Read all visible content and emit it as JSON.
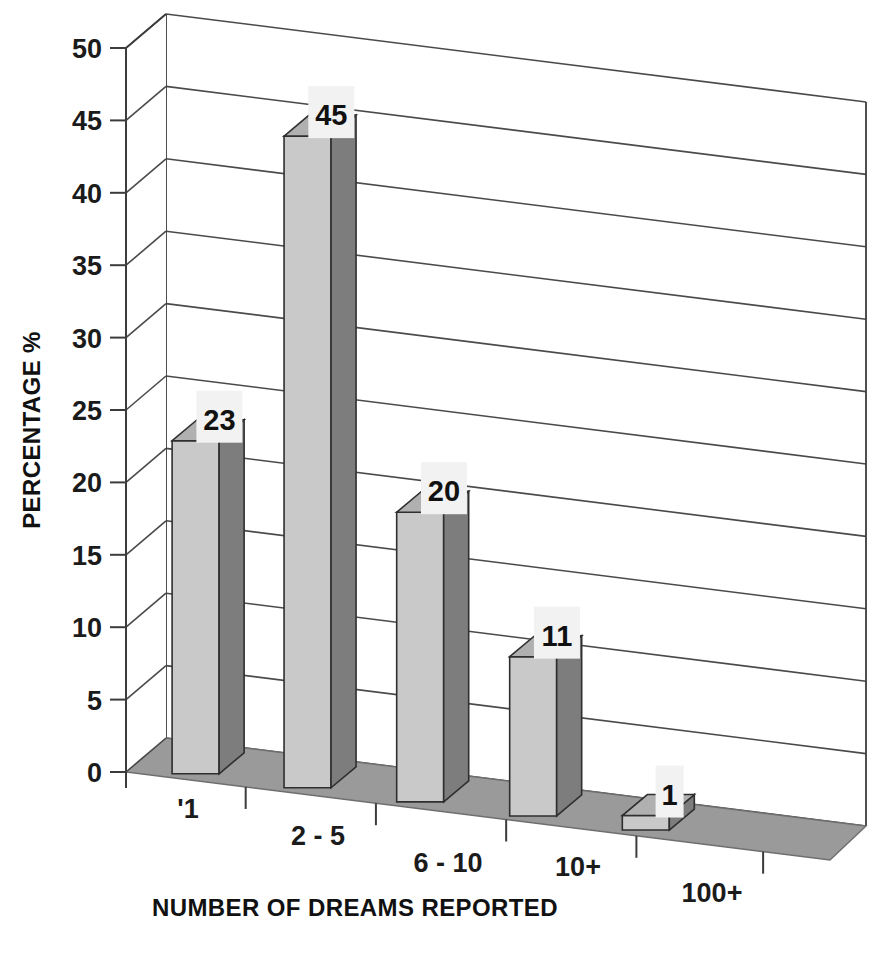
{
  "chart_data": {
    "type": "bar",
    "title": "",
    "subtitle": "",
    "xlabel": "NUMBER OF DREAMS REPORTED",
    "ylabel": "PERCENTAGE %",
    "categories": [
      "'1",
      "2 - 5",
      "6 - 10",
      "10+",
      "100+"
    ],
    "values": [
      23,
      45,
      20,
      11,
      1
    ],
    "data_labels": [
      "23",
      "45",
      "20",
      "11",
      "1"
    ],
    "ylim": [
      0,
      50
    ],
    "ytick_step": 5,
    "ytick_labels": [
      "0",
      "5",
      "10",
      "15",
      "20",
      "25",
      "30",
      "35",
      "40",
      "45",
      "50"
    ],
    "grid": true,
    "grid_axis": "y",
    "legend": false,
    "legend_position": "none",
    "style": "3d-column",
    "series": [
      {
        "name": "Percentage of respondents",
        "values": [
          23,
          45,
          20,
          11,
          1
        ]
      }
    ]
  },
  "colors": {
    "background": "#ffffff",
    "bar_front": "#c9c9c9",
    "bar_side": "#7d7d7d",
    "bar_top": "#b0b0b0",
    "floor": "#9a9a9a",
    "wall": "#ffffff",
    "gridline": "#4a4a4a",
    "text": "#111111",
    "label_box": "#f2f2f2"
  }
}
